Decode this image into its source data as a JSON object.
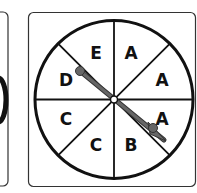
{
  "figure": {
    "colors": {
      "stroke": "#111111",
      "pointer": "#555555",
      "background": "#ffffff"
    },
    "spinner": {
      "sections": [
        {
          "position": "top-right",
          "label": "A"
        },
        {
          "position": "right-upper",
          "label": "A"
        },
        {
          "position": "right-lower",
          "label": "A"
        },
        {
          "position": "bottom-right",
          "label": "B"
        },
        {
          "position": "bottom-left",
          "label": "C"
        },
        {
          "position": "left-lower",
          "label": "C"
        },
        {
          "position": "left-upper",
          "label": "D"
        },
        {
          "position": "top-left",
          "label": "E"
        }
      ],
      "pointer": {
        "from_label": "D",
        "to_label": "A"
      }
    }
  }
}
